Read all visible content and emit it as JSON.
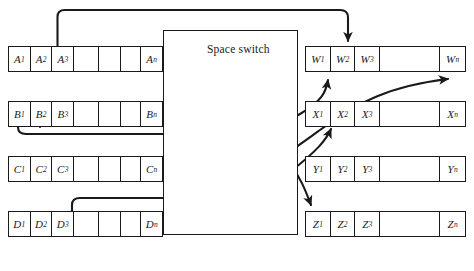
{
  "figure": {
    "type": "space-switch-diagram",
    "width": 474,
    "height": 271,
    "background": "#ffffff",
    "line_color": "#1a1a1a"
  },
  "switch": {
    "label": "Space switch",
    "x": 163,
    "y": 30,
    "width": 135,
    "height": 205
  },
  "input_rows": [
    {
      "name": "A",
      "y": 46,
      "cells": [
        {
          "base": "A",
          "sub": "1"
        },
        {
          "base": "A",
          "sub": "2"
        },
        {
          "base": "A",
          "sub": "3"
        },
        {
          "base": "",
          "sub": ""
        },
        {
          "base": "",
          "sub": ""
        },
        {
          "base": "",
          "sub": ""
        },
        {
          "base": "A",
          "sub": "n"
        }
      ]
    },
    {
      "name": "B",
      "y": 101,
      "cells": [
        {
          "base": "B",
          "sub": "1"
        },
        {
          "base": "B",
          "sub": "2"
        },
        {
          "base": "B",
          "sub": "3"
        },
        {
          "base": "",
          "sub": ""
        },
        {
          "base": "",
          "sub": ""
        },
        {
          "base": "",
          "sub": ""
        },
        {
          "base": "B",
          "sub": "n"
        }
      ]
    },
    {
      "name": "C",
      "y": 156,
      "cells": [
        {
          "base": "C",
          "sub": "1"
        },
        {
          "base": "C",
          "sub": "2"
        },
        {
          "base": "C",
          "sub": "3"
        },
        {
          "base": "",
          "sub": ""
        },
        {
          "base": "",
          "sub": ""
        },
        {
          "base": "",
          "sub": ""
        },
        {
          "base": "C",
          "sub": "n"
        }
      ]
    },
    {
      "name": "D",
      "y": 211,
      "cells": [
        {
          "base": "D",
          "sub": "1"
        },
        {
          "base": "D",
          "sub": "2"
        },
        {
          "base": "D",
          "sub": "3"
        },
        {
          "base": "",
          "sub": ""
        },
        {
          "base": "",
          "sub": ""
        },
        {
          "base": "",
          "sub": ""
        },
        {
          "base": "D",
          "sub": "n"
        }
      ]
    }
  ],
  "output_rows": [
    {
      "name": "W",
      "y": 46,
      "cells": [
        {
          "base": "W",
          "sub": "1"
        },
        {
          "base": "W",
          "sub": "2"
        },
        {
          "base": "W",
          "sub": "3"
        },
        {
          "base": "",
          "sub": ""
        },
        {
          "base": "W",
          "sub": "n"
        }
      ]
    },
    {
      "name": "X",
      "y": 101,
      "cells": [
        {
          "base": "X",
          "sub": "1"
        },
        {
          "base": "X",
          "sub": "2"
        },
        {
          "base": "X",
          "sub": "3"
        },
        {
          "base": "",
          "sub": ""
        },
        {
          "base": "X",
          "sub": "n"
        }
      ]
    },
    {
      "name": "Y",
      "y": 156,
      "cells": [
        {
          "base": "Y",
          "sub": "1"
        },
        {
          "base": "Y",
          "sub": "2"
        },
        {
          "base": "Y",
          "sub": "3"
        },
        {
          "base": "",
          "sub": ""
        },
        {
          "base": "Y",
          "sub": "n"
        }
      ]
    },
    {
      "name": "Z",
      "y": 211,
      "cells": [
        {
          "base": "Z",
          "sub": "1"
        },
        {
          "base": "Z",
          "sub": "2"
        },
        {
          "base": "Z",
          "sub": "3"
        },
        {
          "base": "",
          "sub": ""
        },
        {
          "base": "Z",
          "sub": "n"
        }
      ]
    }
  ],
  "connections": [
    {
      "from": "A3",
      "to": "W3",
      "route": "over-top"
    },
    {
      "from": "B1",
      "to": "W2",
      "route": "through-switch"
    },
    {
      "from": "B2",
      "to": "Z1",
      "route": "through-switch-crossing"
    },
    {
      "from": "Cn",
      "to": "Wn",
      "route": "through-switch-crossing"
    },
    {
      "from": "D2",
      "to": "X2",
      "route": "through-switch"
    }
  ]
}
